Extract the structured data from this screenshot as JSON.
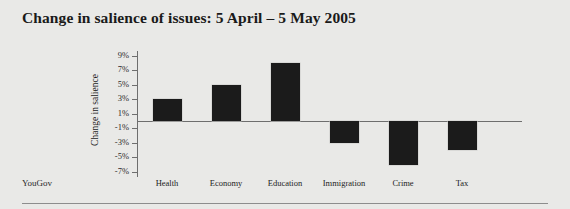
{
  "title": "Change in salience of issues: 5 April – 5 May 2005",
  "source": "YouGov",
  "chart_data": {
    "type": "bar",
    "title": "Change in salience of issues: 5 April – 5 May 2005",
    "xlabel": "",
    "ylabel": "Change in salience",
    "categories": [
      "Health",
      "Economy",
      "Education",
      "Immigration",
      "Crime",
      "Tax"
    ],
    "values": [
      3,
      5,
      8,
      -3,
      -6,
      -4
    ],
    "ytick_labels": [
      "9%",
      "7%",
      "5%",
      "3%",
      "1%",
      "-1%",
      "-3%",
      "-5%",
      "-7%"
    ],
    "ytick_values": [
      9,
      7,
      5,
      3,
      1,
      -1,
      -3,
      -5,
      -7
    ],
    "ylim": [
      -7,
      9
    ],
    "grid": false,
    "legend": "none",
    "bar_color": "#1b1b1b",
    "background_color": "#e9e9e7"
  }
}
